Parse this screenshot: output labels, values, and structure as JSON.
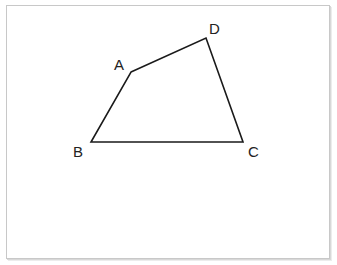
{
  "figure": {
    "shape": "quadrilateral",
    "stroke_color": "#1a1a1a",
    "frame_color": "#c8c8c8",
    "vertices": [
      {
        "name": "A",
        "x": 131,
        "y": 72,
        "label_x": 114,
        "label_y": 70
      },
      {
        "name": "B",
        "x": 91,
        "y": 142,
        "label_x": 73,
        "label_y": 157
      },
      {
        "name": "C",
        "x": 243,
        "y": 142,
        "label_x": 248,
        "label_y": 157
      },
      {
        "name": "D",
        "x": 206,
        "y": 38,
        "label_x": 209,
        "label_y": 34
      }
    ],
    "labels": {
      "A": "A",
      "B": "B",
      "C": "C",
      "D": "D"
    }
  }
}
